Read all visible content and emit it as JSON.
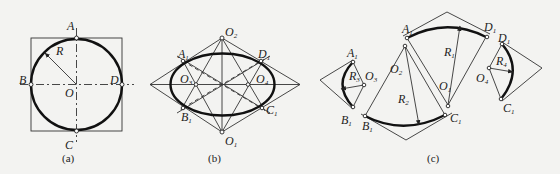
{
  "figure": {
    "panel_a": {
      "caption": "(a)",
      "labels": {
        "A": "A",
        "B": "B",
        "C": "C",
        "D": "D",
        "O": "O",
        "R": "R"
      }
    },
    "panel_b": {
      "caption": "(b)",
      "labels": {
        "A1": "A",
        "A1_sub": "1",
        "B1": "B",
        "B1_sub": "1",
        "C1": "C",
        "C1_sub": "1",
        "D1": "D",
        "D1_sub": "1",
        "O1": "O",
        "O1_sub": "1",
        "O2": "O",
        "O2_sub": "2",
        "O3": "O",
        "O3_sub": "3",
        "O4": "O",
        "O4_sub": "4"
      }
    },
    "panel_c": {
      "caption": "(c)",
      "labels": {
        "A1": "A",
        "A1_sub": "1",
        "B1": "B",
        "B1_sub": "1",
        "C1": "C",
        "C1_sub": "1",
        "D1": "D",
        "D1_sub": "1",
        "O1": "O",
        "O1_sub": "1",
        "O2": "O",
        "O2_sub": "2",
        "O3": "O",
        "O3_sub": "3",
        "O4": "O",
        "O4_sub": "4",
        "R1": "R",
        "R1_sub": "1",
        "R2": "R",
        "R2_sub": "2",
        "R3": "R",
        "R3_sub": "3",
        "R4": "R",
        "R4_sub": "4"
      }
    }
  }
}
